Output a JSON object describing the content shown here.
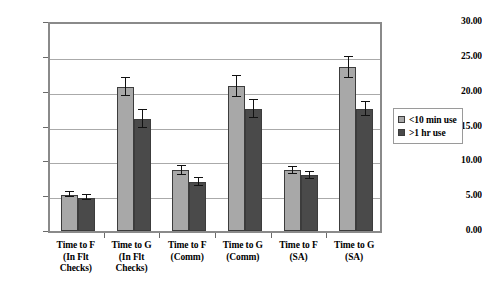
{
  "chart_data": {
    "type": "bar",
    "title": "",
    "xlabel": "",
    "ylabel": "",
    "ylim": [
      0,
      30
    ],
    "ytick_step": 5,
    "grid": true,
    "legend_position": "right",
    "categories": [
      "Time to F (In Flt Checks)",
      "Time to G (In Flt Checks)",
      "Time to F (Comm)",
      "Time to G (Comm)",
      "Time to F (SA)",
      "Time to G (SA)"
    ],
    "category_lines": [
      [
        "Time to F",
        "(In Flt",
        "Checks)"
      ],
      [
        "Time to G",
        "(In Flt",
        "Checks)"
      ],
      [
        "Time to F",
        "(Comm)"
      ],
      [
        "Time to G",
        "(Comm)"
      ],
      [
        "Time to F",
        "(SA)"
      ],
      [
        "Time to G",
        "(SA)"
      ]
    ],
    "ytick_labels": [
      "30.00",
      "25.00",
      "20.00",
      "15.00",
      "10.00",
      "5.00",
      "0.00"
    ],
    "ytick_values": [
      30,
      25,
      20,
      15,
      10,
      5,
      0
    ],
    "series": [
      {
        "name": "<10 min use",
        "color": "#a8a8a8",
        "values": [
          5.2,
          20.7,
          8.7,
          20.8,
          8.7,
          23.5
        ],
        "errors": [
          0.35,
          1.3,
          0.7,
          1.5,
          0.5,
          1.5
        ]
      },
      {
        "name": ">1 hr use",
        "color": "#4a4a4a",
        "values": [
          4.8,
          16.1,
          7.0,
          17.5,
          8.0,
          17.5
        ],
        "errors": [
          0.35,
          1.3,
          0.55,
          1.3,
          0.5,
          1.0
        ]
      }
    ]
  },
  "legend": {
    "items": [
      {
        "label": "<10 min use",
        "swatch": "light"
      },
      {
        "label": ">1 hr use",
        "swatch": "dark"
      }
    ]
  }
}
